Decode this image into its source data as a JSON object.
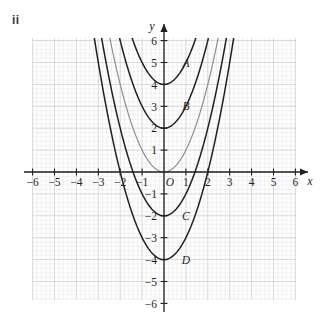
{
  "item_label": "ii",
  "axes": {
    "x_name": "x",
    "y_name": "y",
    "origin_label": "O",
    "x_ticks": [
      "-6",
      "-5",
      "-4",
      "-3",
      "-2",
      "-1",
      "1",
      "2",
      "3",
      "4",
      "5",
      "6"
    ],
    "y_ticks": [
      "6",
      "5",
      "4",
      "3",
      "2",
      "1",
      "-1",
      "-2",
      "-3",
      "-4",
      "-5",
      "-6"
    ]
  },
  "curve_labels": {
    "A": "A",
    "B": "B",
    "C": "C",
    "D": "D"
  },
  "colors": {
    "grid_minor": "#e3e3e6",
    "grid_major": "#c9c9cf",
    "axis": "#231f20",
    "curve_dark": "#231f20",
    "curve_gray": "#8e8e93",
    "text": "#231f20"
  },
  "chart_data": {
    "type": "line",
    "title": "",
    "xlabel": "x",
    "ylabel": "y",
    "xlim": [
      -6.6,
      6.6
    ],
    "ylim": [
      -6.6,
      6.6
    ],
    "grid": true,
    "grid_minor_step": 0.2,
    "grid_major_step": 1,
    "legend": "inline-labels",
    "series": [
      {
        "name": "A",
        "equation": "y = x^2 + 4",
        "label": "A",
        "label_point": [
          1.0,
          5.0
        ],
        "vertex": [
          0,
          4
        ],
        "color": "#231f20",
        "a": 1,
        "c": 4
      },
      {
        "name": "B",
        "equation": "y = x^2 + 2",
        "label": "B",
        "label_point": [
          1.0,
          3.0
        ],
        "vertex": [
          0,
          2
        ],
        "color": "#231f20",
        "a": 1,
        "c": 2
      },
      {
        "name": "unlabeled-gray",
        "equation": "y = x^2",
        "label": "",
        "label_point": null,
        "vertex": [
          0,
          0
        ],
        "color": "#8e8e93",
        "a": 1,
        "c": 0
      },
      {
        "name": "C",
        "equation": "y = x^2 - 2",
        "label": "C",
        "label_point": [
          1.0,
          -2.0
        ],
        "vertex": [
          0,
          -2
        ],
        "color": "#231f20",
        "a": 1,
        "c": -2
      },
      {
        "name": "D",
        "equation": "y = x^2 - 4",
        "label": "D",
        "label_point": [
          1.0,
          -4.0
        ],
        "vertex": [
          0,
          -4
        ],
        "color": "#231f20",
        "a": 1,
        "c": -4
      }
    ]
  }
}
